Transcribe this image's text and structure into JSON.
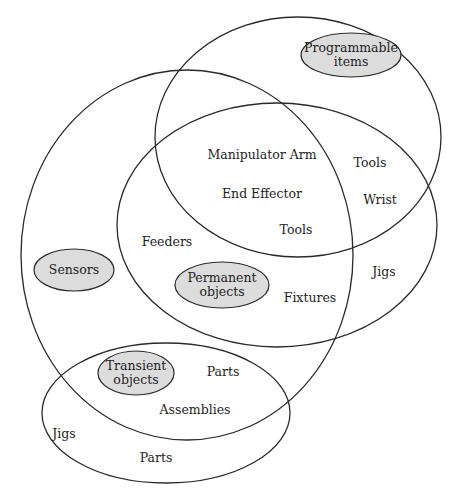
{
  "diagram": {
    "type": "venn",
    "sets": [
      {
        "id": "sensors",
        "label": "Sensors",
        "outline": {
          "cx": 187,
          "cy": 255,
          "rx": 166,
          "ry": 185
        },
        "tag": {
          "cx": 74,
          "cy": 270,
          "rx": 40,
          "ry": 21
        }
      },
      {
        "id": "programmable",
        "label_line1": "Programmable",
        "label_line2": "items",
        "outline": {
          "cx": 298,
          "cy": 137,
          "rx": 143,
          "ry": 120
        },
        "tag": {
          "cx": 351,
          "cy": 55,
          "rx": 50,
          "ry": 22
        }
      },
      {
        "id": "permanent",
        "label_line1": "Permanent",
        "label_line2": "objects",
        "outline": {
          "cx": 277,
          "cy": 225,
          "rx": 160,
          "ry": 122
        },
        "tag": {
          "cx": 222,
          "cy": 285,
          "rx": 47,
          "ry": 23
        }
      },
      {
        "id": "transient",
        "label_line1": "Transient",
        "label_line2": "objects",
        "outline": {
          "cx": 166,
          "cy": 413,
          "rx": 124,
          "ry": 70
        },
        "tag": {
          "cx": 136,
          "cy": 373,
          "rx": 38,
          "ry": 22
        }
      }
    ],
    "items": [
      {
        "text": "Manipulator Arm",
        "x": 262,
        "y": 155
      },
      {
        "text": "End Effector",
        "x": 262,
        "y": 194
      },
      {
        "text": "Tools",
        "x": 296,
        "y": 230
      },
      {
        "text": "Tools",
        "x": 370,
        "y": 163
      },
      {
        "text": "Wrist",
        "x": 380,
        "y": 200
      },
      {
        "text": "Feeders",
        "x": 167,
        "y": 242
      },
      {
        "text": "Fixtures",
        "x": 310,
        "y": 298
      },
      {
        "text": "Jigs",
        "x": 384,
        "y": 272
      },
      {
        "text": "Parts",
        "x": 223,
        "y": 372
      },
      {
        "text": "Assemblies",
        "x": 195,
        "y": 410
      },
      {
        "text": "Jigs",
        "x": 64,
        "y": 434
      },
      {
        "text": "Parts",
        "x": 156,
        "y": 458
      }
    ]
  }
}
